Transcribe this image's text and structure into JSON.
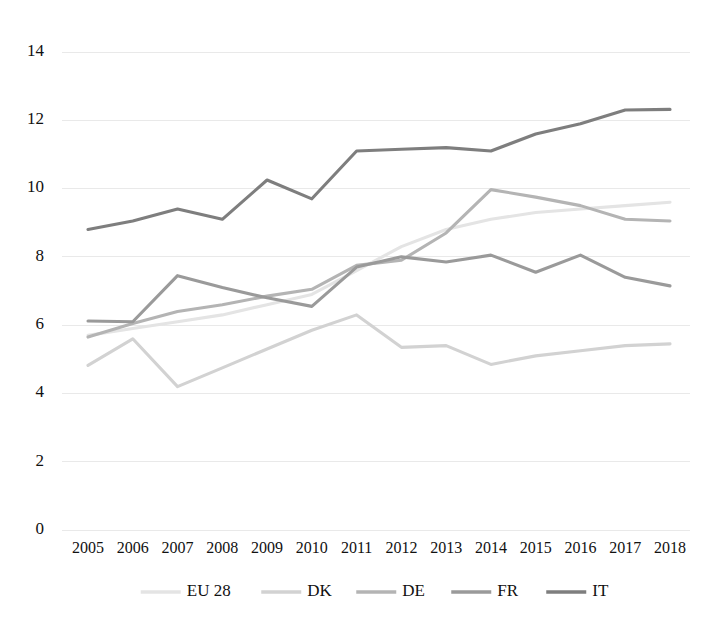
{
  "chart_data": {
    "type": "line",
    "title": "",
    "subtitle": "",
    "xlabel": "",
    "ylabel": "",
    "grid": true,
    "legend_position": "bottom",
    "xlim": [
      2005,
      2018
    ],
    "ylim": [
      0,
      14
    ],
    "ytick_values": [
      0,
      2,
      4,
      6,
      8,
      10,
      12,
      14
    ],
    "ytick_labels": [
      "0",
      "2",
      "4",
      "6",
      "8",
      "10",
      "12",
      "14"
    ],
    "categories": [
      2005,
      2006,
      2007,
      2008,
      2009,
      2010,
      2011,
      2012,
      2013,
      2014,
      2015,
      2016,
      2017,
      2018
    ],
    "xtick_labels": [
      "2005",
      "2006",
      "2007",
      "2008",
      "2009",
      "2010",
      "2011",
      "2012",
      "2013",
      "2014",
      "2015",
      "2016",
      "2017",
      "2018"
    ],
    "series": [
      {
        "name": "EU 28",
        "color": "#e4e4e4",
        "values": [
          5.7,
          5.9,
          6.1,
          6.3,
          6.6,
          6.9,
          7.6,
          8.3,
          8.8,
          9.1,
          9.3,
          9.4,
          9.5,
          9.6
        ]
      },
      {
        "name": "DK",
        "color": "#d2d2d2",
        "values": [
          4.82,
          5.6,
          4.2,
          4.75,
          5.3,
          5.85,
          6.3,
          5.35,
          5.4,
          4.85,
          5.1,
          5.25,
          5.4,
          5.45
        ]
      },
      {
        "name": "DE",
        "color": "#b4b4b4",
        "values": [
          5.65,
          6.05,
          6.4,
          6.6,
          6.85,
          7.05,
          7.75,
          7.9,
          8.7,
          9.97,
          9.75,
          9.5,
          9.1,
          9.05
        ]
      },
      {
        "name": "FR",
        "color": "#9a9a9a",
        "values": [
          6.12,
          6.1,
          7.45,
          7.1,
          6.8,
          6.55,
          7.7,
          8.0,
          7.85,
          8.05,
          7.55,
          8.05,
          7.4,
          7.15
        ]
      },
      {
        "name": "IT",
        "color": "#7e7e7e",
        "values": [
          8.8,
          9.05,
          9.4,
          9.1,
          10.25,
          9.7,
          11.1,
          11.15,
          11.2,
          11.1,
          11.6,
          11.9,
          12.3,
          12.32
        ]
      }
    ],
    "legend_entries": [
      {
        "label": "EU 28",
        "color": "#e4e4e4"
      },
      {
        "label": "DK",
        "color": "#d2d2d2"
      },
      {
        "label": "DE",
        "color": "#b4b4b4"
      },
      {
        "label": "FR",
        "color": "#9a9a9a"
      },
      {
        "label": "IT",
        "color": "#7e7e7e"
      }
    ]
  }
}
